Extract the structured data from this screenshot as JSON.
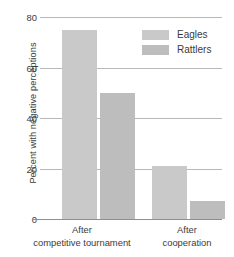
{
  "chart_data": {
    "type": "bar",
    "title": "",
    "subtitle": "",
    "xlabel": "",
    "ylabel": "Percent with negative perceptions",
    "categories": [
      "After competitive tournament",
      "After cooperation"
    ],
    "category_lines": [
      [
        "After",
        "competitive tournament"
      ],
      [
        "After",
        "cooperation"
      ]
    ],
    "series": [
      {
        "name": "Eagles",
        "values": [
          75,
          21
        ],
        "color": "#c9c9c9"
      },
      {
        "name": "Rattlers",
        "values": [
          50,
          7
        ],
        "color": "#bdbdbd"
      }
    ],
    "ylim": [
      0,
      80
    ],
    "yticks": [
      0,
      20,
      40,
      60,
      80
    ],
    "ytick_labels": [
      "0",
      "20",
      "40",
      "60",
      "80"
    ],
    "grid": true,
    "grid_color": "#b9b9b9",
    "legend_position": "top-right",
    "background": "#ffffff",
    "text_color": "#3b3b3b"
  }
}
